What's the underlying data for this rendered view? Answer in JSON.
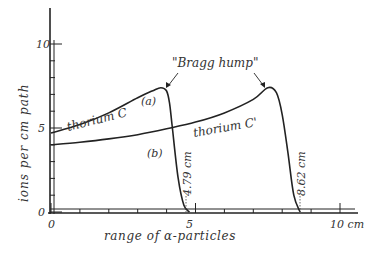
{
  "chart_data": {
    "type": "line",
    "title": "",
    "xlabel": "range of α-particles",
    "ylabel": "ions per cm path",
    "xlim": [
      0,
      10.5
    ],
    "ylim": [
      0,
      11
    ],
    "x_ticks": [
      "0",
      "5",
      "10 cm"
    ],
    "y_ticks": [
      "0",
      "5",
      "10"
    ],
    "grid": false,
    "annotations": [
      {
        "text": "\"Bragg hump\"",
        "points_to": [
          "peak of (a)",
          "peak of (b)"
        ]
      },
      {
        "text": "4.79 cm",
        "x": 4.79,
        "note": "end of range of thorium C"
      },
      {
        "text": "8.62 cm",
        "x": 8.62,
        "note": "end of range of thorium C'"
      }
    ],
    "series": [
      {
        "name": "thorium C",
        "tag": "(a)",
        "x": [
          0,
          1,
          2,
          3,
          3.5,
          3.8,
          4.0,
          4.1,
          4.2,
          4.4,
          4.6,
          4.79
        ],
        "y": [
          4.7,
          5.2,
          5.9,
          6.8,
          7.2,
          7.4,
          7.2,
          6.5,
          5.0,
          2.0,
          0.4,
          0
        ]
      },
      {
        "name": "thorium C'",
        "tag": "(b)",
        "x": [
          0,
          1,
          2,
          3,
          4,
          5,
          6,
          7,
          7.5,
          7.8,
          8.0,
          8.2,
          8.4,
          8.62
        ],
        "y": [
          4.0,
          4.15,
          4.35,
          4.6,
          4.95,
          5.35,
          5.9,
          6.7,
          7.4,
          7.1,
          5.8,
          3.5,
          1.0,
          0
        ]
      }
    ]
  },
  "labels": {
    "ylabel": "ions per cm path",
    "xlabel": "range of α-particles",
    "y10": "10",
    "y5": "5",
    "y0": "0",
    "x0": "0",
    "x5": "5",
    "x10": "10 cm",
    "bragg": "\"Bragg hump\"",
    "seriesA": "thorium C",
    "seriesB": "thorium C'",
    "tagA": "(a)",
    "tagB": "(b)",
    "rangeA": "4.79 cm",
    "rangeB": "8.62 cm"
  }
}
